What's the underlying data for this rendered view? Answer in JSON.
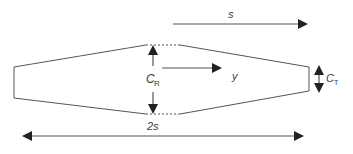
{
  "diagram": {
    "labels": {
      "span_half": "s",
      "root_chord_main": "C",
      "root_chord_sub": "R",
      "tip_chord_main": "C",
      "tip_chord_sub": "T",
      "spanwise_coord": "y",
      "full_span": "2s"
    },
    "colors": {
      "stroke": "#555555",
      "arrow": "#222222",
      "text": "#3a3a3a",
      "background": "#ffffff"
    }
  }
}
